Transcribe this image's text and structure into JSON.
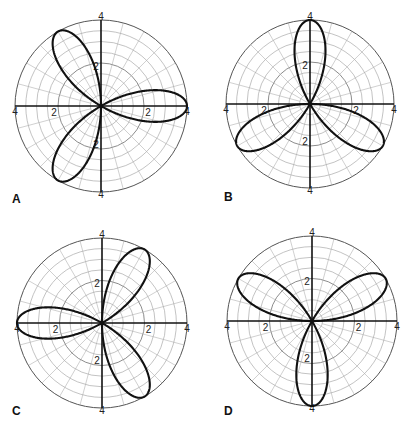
{
  "chart_data": [
    {
      "type": "line",
      "subtype": "polar",
      "panel": "A",
      "equation": "r = 4cos(3θ)",
      "amplitude": 4,
      "k": 3,
      "trig": "cos",
      "sign": 1,
      "petal_angles_deg": [
        0,
        120,
        240
      ],
      "r_ticks": [
        2,
        4
      ],
      "rlim": [
        0,
        4
      ],
      "grid": {
        "ring_step": 0.5,
        "spoke_step_deg": 15
      },
      "center": [
        101,
        106
      ],
      "radius_px": 86
    },
    {
      "type": "line",
      "subtype": "polar",
      "panel": "B",
      "equation": "r = -4sin(3θ)",
      "amplitude": 4,
      "k": 3,
      "trig": "sin",
      "sign": -1,
      "petal_angles_deg": [
        90,
        210,
        330
      ],
      "r_ticks": [
        2,
        4
      ],
      "rlim": [
        0,
        4
      ],
      "grid": {
        "ring_step": 0.5,
        "spoke_step_deg": 15
      },
      "center": [
        310,
        104
      ],
      "radius_px": 84
    },
    {
      "type": "line",
      "subtype": "polar",
      "panel": "C",
      "equation": "r = -4cos(3θ)",
      "amplitude": 4,
      "k": 3,
      "trig": "cos",
      "sign": -1,
      "petal_angles_deg": [
        60,
        180,
        300
      ],
      "r_ticks": [
        2,
        4
      ],
      "rlim": [
        0,
        4
      ],
      "grid": {
        "ring_step": 0.5,
        "spoke_step_deg": 15
      },
      "center": [
        102,
        323
      ],
      "radius_px": 85
    },
    {
      "type": "line",
      "subtype": "polar",
      "panel": "D",
      "equation": "r = 4sin(3θ)",
      "amplitude": 4,
      "k": 3,
      "trig": "sin",
      "sign": 1,
      "petal_angles_deg": [
        30,
        150,
        270
      ],
      "r_ticks": [
        2,
        4
      ],
      "rlim": [
        0,
        4
      ],
      "grid": {
        "ring_step": 0.5,
        "spoke_step_deg": 15
      },
      "center": [
        312,
        321
      ],
      "radius_px": 85
    }
  ],
  "panels": [
    {
      "label": "A",
      "label_pos": [
        12,
        192
      ]
    },
    {
      "label": "B",
      "label_pos": [
        224,
        190
      ]
    },
    {
      "label": "C",
      "label_pos": [
        12,
        404
      ]
    },
    {
      "label": "D",
      "label_pos": [
        224,
        404
      ]
    }
  ],
  "tick_labels": {
    "inner": "2",
    "outer": "4"
  }
}
